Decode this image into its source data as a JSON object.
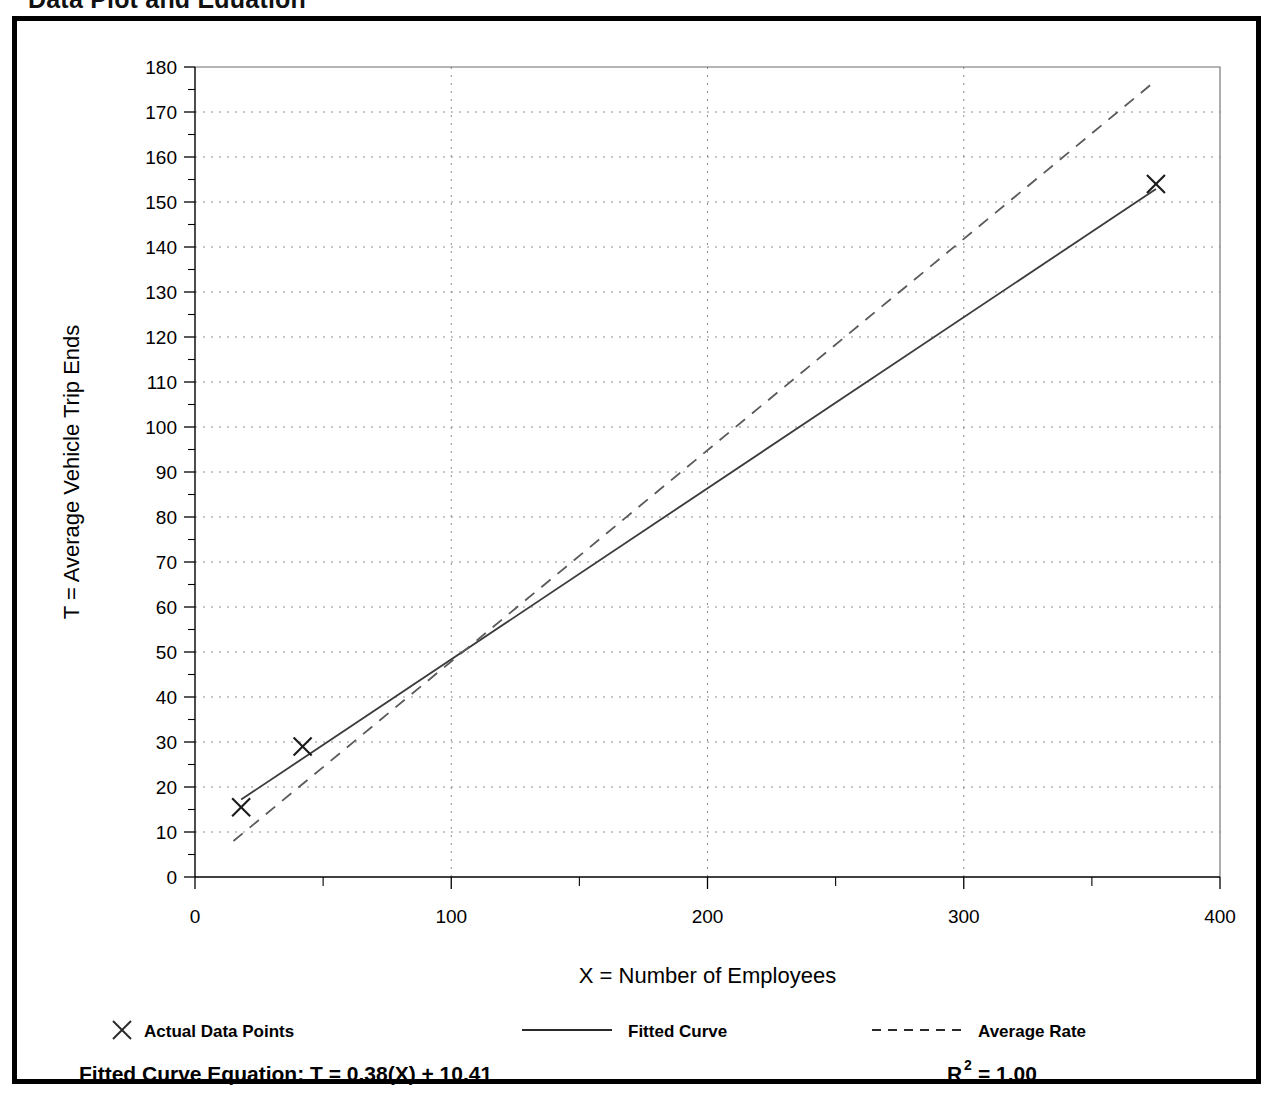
{
  "page": {
    "heading": "Data Plot and Equation"
  },
  "chart_data": {
    "type": "scatter",
    "title": "",
    "xlabel": "X = Number of Employees",
    "ylabel": "T = Average Vehicle Trip Ends",
    "xlim": [
      0,
      400
    ],
    "ylim": [
      0,
      180
    ],
    "x_ticks": [
      0,
      100,
      200,
      300,
      400
    ],
    "x_tick_labels": [
      "0",
      "100",
      "200",
      "300",
      "400"
    ],
    "x_minor_step": 50,
    "y_ticks": [
      0,
      10,
      20,
      30,
      40,
      50,
      60,
      70,
      80,
      90,
      100,
      110,
      120,
      130,
      140,
      150,
      160,
      170,
      180
    ],
    "y_tick_labels": [
      "0",
      "10",
      "20",
      "30",
      "40",
      "50",
      "60",
      "70",
      "80",
      "90",
      "100",
      "110",
      "120",
      "130",
      "140",
      "150",
      "160",
      "170",
      "180"
    ],
    "y_minor_step": 5,
    "grid": true,
    "grid_style": "dotted",
    "legend_position": "below-axis",
    "series": [
      {
        "name": "Actual Data Points",
        "style": "marker-x",
        "points": [
          {
            "x": 18,
            "y": 15.5
          },
          {
            "x": 42,
            "y": 29.0
          },
          {
            "x": 375,
            "y": 154.0
          }
        ]
      },
      {
        "name": "Fitted Curve",
        "style": "solid-line",
        "points": [
          {
            "x": 18,
            "y": 17.2
          },
          {
            "x": 375,
            "y": 152.9
          }
        ]
      },
      {
        "name": "Average Rate",
        "style": "dashed-line",
        "points": [
          {
            "x": 15,
            "y": 8.0
          },
          {
            "x": 375,
            "y": 177.0
          }
        ]
      }
    ],
    "annotations": {
      "equation_label": "Fitted Curve Equation:",
      "equation": "T = 0.38(X) + 10.41",
      "r_squared_base": "R",
      "r_squared_exponent": "2",
      "r_squared_value": "= 1.00"
    }
  },
  "legend": {
    "items": [
      {
        "label": "Actual Data Points",
        "marker": "x-marker-icon"
      },
      {
        "label": "Fitted Curve",
        "marker": "solid-line-icon"
      },
      {
        "label": "Average Rate",
        "marker": "dashed-line-icon"
      }
    ]
  },
  "colors": {
    "frame": "#000000",
    "grid": "#8c8c8c",
    "fitted": "#3a3a3a",
    "average": "#5a5a5a",
    "marker": "#1a1a1a"
  }
}
